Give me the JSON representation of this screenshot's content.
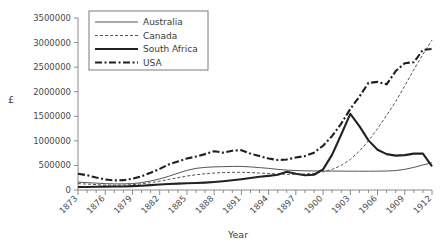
{
  "chart_data": {
    "type": "line",
    "title": "",
    "xlabel": "Year",
    "ylabel": "£",
    "xlim": [
      1873,
      1912
    ],
    "ylim": [
      0,
      3500000
    ],
    "ytick_step": 500000,
    "yticks": [
      0,
      500000,
      1000000,
      1500000,
      2000000,
      2500000,
      3000000,
      3500000
    ],
    "ytick_labels": [
      "0",
      "500000",
      "1000000",
      "1500000",
      "2000000",
      "2500000",
      "3000000",
      "3500000"
    ],
    "x": [
      1873,
      1874,
      1875,
      1876,
      1877,
      1878,
      1879,
      1880,
      1881,
      1882,
      1883,
      1884,
      1885,
      1886,
      1887,
      1888,
      1889,
      1890,
      1891,
      1892,
      1893,
      1894,
      1895,
      1896,
      1897,
      1898,
      1899,
      1900,
      1901,
      1902,
      1903,
      1904,
      1905,
      1906,
      1907,
      1908,
      1909,
      1910,
      1911,
      1912
    ],
    "xtick_labels": [
      "1873",
      "1876",
      "1879",
      "1882",
      "1885",
      "1888",
      "1891",
      "1894",
      "1897",
      "1900",
      "1903",
      "1906",
      "1909",
      "1912"
    ],
    "xtick_label_step": 3,
    "xtick_label_rotation": 45,
    "grid": false,
    "legend_position": "top-left",
    "series": [
      {
        "name": "Australia",
        "style": "solid-thin",
        "color": "#555555",
        "values": [
          160000,
          150000,
          140000,
          130000,
          125000,
          125000,
          130000,
          150000,
          185000,
          225000,
          280000,
          340000,
          400000,
          440000,
          460000,
          470000,
          475000,
          480000,
          480000,
          470000,
          455000,
          440000,
          420000,
          405000,
          395000,
          390000,
          388000,
          386000,
          385000,
          384000,
          383000,
          382000,
          382000,
          383000,
          386000,
          395000,
          420000,
          460000,
          510000,
          555000
        ]
      },
      {
        "name": "Canada",
        "style": "dotted",
        "color": "#555555",
        "values": [
          130000,
          120000,
          110000,
          100000,
          98000,
          100000,
          108000,
          125000,
          150000,
          180000,
          215000,
          250000,
          285000,
          310000,
          330000,
          345000,
          355000,
          360000,
          360000,
          355000,
          345000,
          335000,
          325000,
          320000,
          320000,
          325000,
          340000,
          370000,
          420000,
          500000,
          620000,
          790000,
          1000000,
          1250000,
          1520000,
          1800000,
          2120000,
          2450000,
          2760000,
          3050000
        ]
      },
      {
        "name": "South Africa",
        "style": "solid-thick",
        "color": "#222222",
        "values": [
          60000,
          62000,
          65000,
          68000,
          70000,
          72000,
          78000,
          88000,
          100000,
          112000,
          122000,
          130000,
          136000,
          142000,
          150000,
          162000,
          178000,
          198000,
          220000,
          245000,
          268000,
          288000,
          310000,
          370000,
          330000,
          300000,
          310000,
          420000,
          720000,
          1130000,
          1550000,
          1300000,
          1010000,
          820000,
          730000,
          700000,
          710000,
          740000,
          740000,
          480000
        ]
      },
      {
        "name": "USA",
        "style": "dash-dot",
        "color": "#1f1f1f",
        "values": [
          330000,
          300000,
          255000,
          215000,
          195000,
          200000,
          230000,
          280000,
          350000,
          430000,
          520000,
          580000,
          640000,
          680000,
          730000,
          790000,
          760000,
          800000,
          810000,
          740000,
          690000,
          640000,
          610000,
          620000,
          660000,
          690000,
          760000,
          900000,
          1100000,
          1350000,
          1650000,
          1900000,
          2180000,
          2200000,
          2150000,
          2420000,
          2580000,
          2600000,
          2850000,
          2870000
        ]
      }
    ]
  },
  "legend": {
    "entries": [
      {
        "label": "Australia"
      },
      {
        "label": "Canada"
      },
      {
        "label": "South Africa"
      },
      {
        "label": "USA"
      }
    ]
  }
}
